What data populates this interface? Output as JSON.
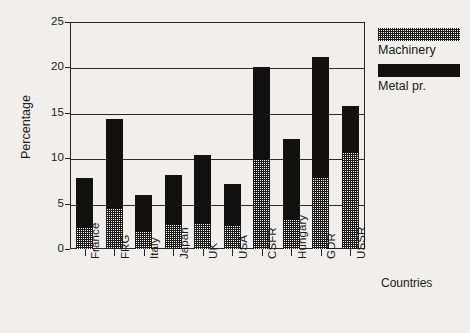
{
  "chart_data": {
    "type": "bar",
    "subtype": "stacked-vertical",
    "title": "",
    "xlabel": "Countries",
    "ylabel": "Percentage",
    "ylim": [
      0,
      25
    ],
    "yticks": [
      0,
      5,
      10,
      15,
      20,
      25
    ],
    "ytick_labels": [
      "0",
      "5",
      "10",
      "15",
      "20",
      "25"
    ],
    "grid": true,
    "grid_axis": "y",
    "legend_position": "right-top",
    "categories": [
      "France",
      "FRG",
      "Italy",
      "Japan",
      "UK",
      "USA",
      "CSFR",
      "Hungary",
      "GDR",
      "USSR"
    ],
    "series": [
      {
        "name": "Machinery",
        "pattern": "hatched",
        "color": "#1a1a1a",
        "values": [
          2.3,
          4.4,
          1.9,
          2.6,
          2.8,
          2.5,
          9.8,
          3.2,
          7.8,
          10.6
        ]
      },
      {
        "name": "Metal pr.",
        "pattern": "solid",
        "color": "#111111",
        "values": [
          5.5,
          9.9,
          4.1,
          5.6,
          7.5,
          4.7,
          10.2,
          8.9,
          13.4,
          5.2
        ]
      }
    ],
    "totals": [
      7.8,
      14.3,
      6.0,
      8.2,
      10.3,
      7.2,
      20.0,
      12.1,
      21.2,
      15.8
    ]
  },
  "legend": {
    "items": [
      {
        "label": "Machinery",
        "swatch": "hatched-swatch"
      },
      {
        "label": "Metal pr.",
        "swatch": "solid-black-swatch"
      }
    ]
  },
  "axes": {
    "y_title": "Percentage",
    "x_title": "Countries"
  },
  "colors": {
    "background": "#f0efeb",
    "axis": "#262626",
    "metal": "#111111",
    "machinery": "#1a1a1a"
  }
}
